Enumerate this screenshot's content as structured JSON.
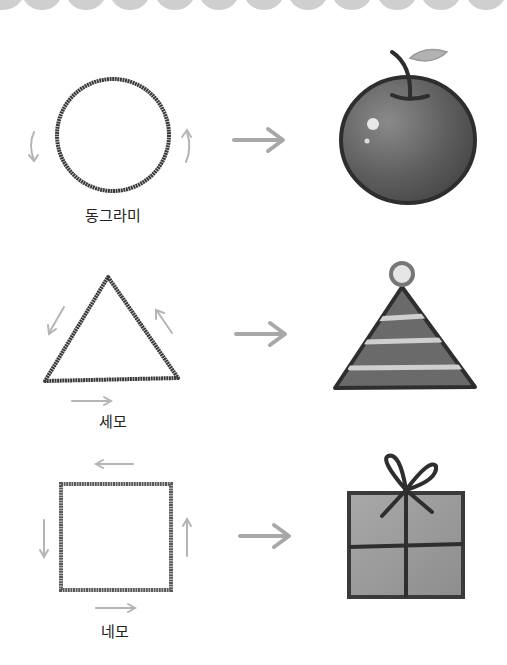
{
  "rows": [
    {
      "shape": "circle",
      "label": "동그라미",
      "object": "apple",
      "arrow_icon": "right-arrow-icon"
    },
    {
      "shape": "triangle",
      "label": "세모",
      "object": "party-hat",
      "arrow_icon": "right-arrow-icon"
    },
    {
      "shape": "square",
      "label": "네모",
      "object": "gift-box",
      "arrow_icon": "right-arrow-icon"
    }
  ],
  "colors": {
    "stroke": "#3a3a3a",
    "guide_arrow": "#b5b5b5",
    "scallop": "#cfcfcf",
    "fill_dark": "#5e5e5e",
    "fill_mid": "#8a8a8a",
    "fill_light": "#a9a9a9"
  }
}
